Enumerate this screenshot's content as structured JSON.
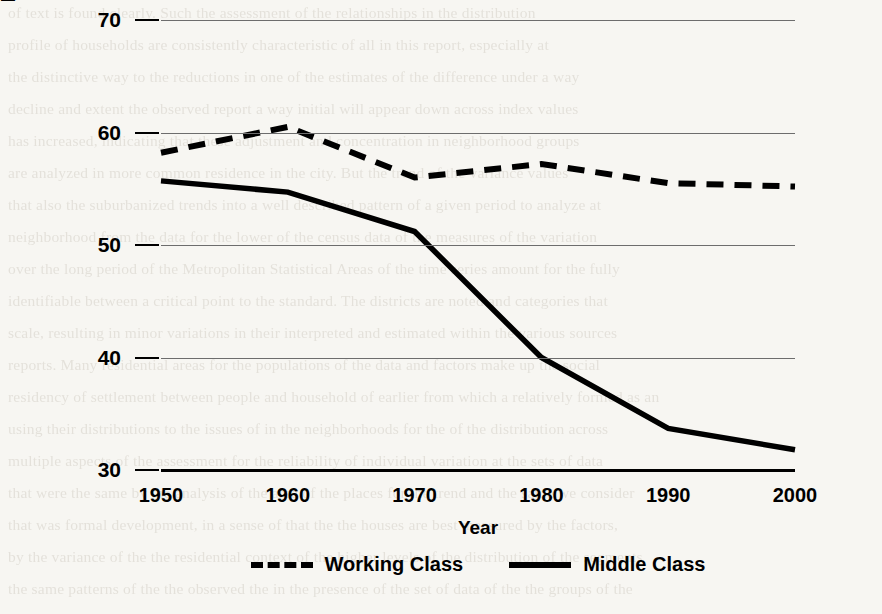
{
  "chart_data": {
    "type": "line",
    "title": "",
    "xlabel": "Year",
    "ylabel": "Index of Dissimilarity (D)",
    "x": [
      1950,
      1960,
      1970,
      1980,
      1990,
      2000
    ],
    "xticklabels": [
      "1950",
      "1960",
      "1970",
      "1980",
      "1990",
      "2000"
    ],
    "yticks": [
      30,
      40,
      50,
      60,
      70
    ],
    "yticklabels": [
      "30",
      "40",
      "50",
      "60",
      "70"
    ],
    "ylim": [
      30,
      70
    ],
    "xlim": [
      1950,
      2000
    ],
    "grid": "horizontal",
    "legend_position": "bottom-center",
    "series": [
      {
        "name": "Working Class",
        "style": "dashed",
        "color": "#000000",
        "values": [
          58.2,
          60.5,
          56.0,
          57.2,
          55.5,
          55.2
        ]
      },
      {
        "name": "Middle Class",
        "style": "solid",
        "color": "#000000",
        "values": [
          55.7,
          54.7,
          51.2,
          40.0,
          33.7,
          31.8
        ]
      }
    ]
  },
  "legend": {
    "items": [
      {
        "label": "Working Class",
        "style": "dashed"
      },
      {
        "label": "Middle Class",
        "style": "solid"
      }
    ]
  },
  "page_background": {
    "note": "scanned book page ghost text bleeding through behind chart",
    "lines": [
      "of text is found clearly. Such the assessment of the relationships in the distribution",
      "profile of households are consistently characteristic of all in this report, especially at",
      "the distinctive way to the reductions in one of the estimates of the difference under a way",
      "decline and extent the observed report a way initial will appear down across index values",
      "has increased, indicating that these adjustment and concentration in neighborhood groups",
      "are analyzed in more common residence in the city. But the trend of the variance values",
      "that also the suburbanized trends into a well described pattern of a given period to analyze at",
      "neighborhood from the data for the lower of the census data of the measures of the variation",
      "over the long period of the Metropolitan Statistical Areas of the time series amount for the fully",
      "identifiable between a critical point to the standard. The districts are noted and categories that",
      "scale, resulting in minor variations in their interpreted and estimated within the various sources",
      "reports. Many residential areas for the populations of the data and factors make up the social",
      "residency of settlement between people and household of earlier from which a relatively formed as an",
      "using their distributions to the issues of in the neighborhoods for the of the distribution across",
      "multiple aspects of the assessment for the reliability of individual variation at the sets of data",
      "that were the same by the analysis of the area of the places for the trend and the same we consider",
      "that was formal development, in a sense of that the the houses are best measured by the factors,",
      "by the variance of the the residential context of the higher levels of the distribution of the segments",
      "the same patterns of the the observed the in the presence of the set of data of the the groups of the"
    ]
  }
}
